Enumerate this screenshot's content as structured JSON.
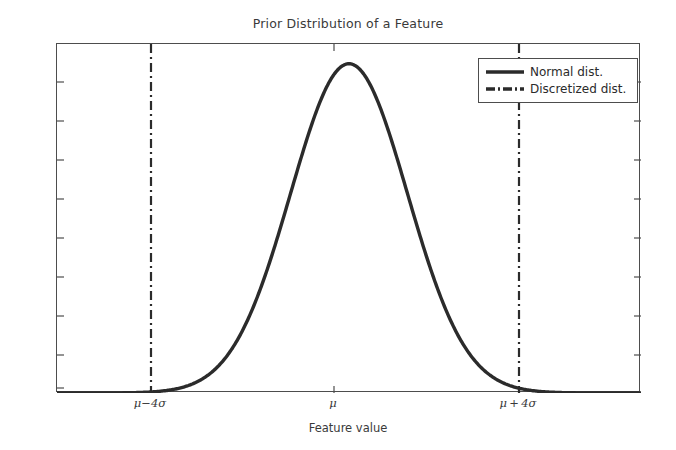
{
  "chart_data": {
    "type": "line",
    "title": "Prior Distribution of a Feature",
    "xlabel": "Feature value",
    "ylabel": "Probability",
    "grid": false,
    "legend_position": "upper right",
    "xlim": [
      -5.0,
      5.0
    ],
    "ylim": [
      0,
      1.06
    ],
    "xticks": [
      -4,
      0,
      4
    ],
    "xtick_labels": [
      "μ−4σ",
      "μ",
      "μ + 4σ"
    ],
    "ytick_labels": [],
    "yticks_count": 9,
    "series": [
      {
        "name": "Normal dist.",
        "type": "line",
        "style": "solid",
        "color": "#2b2b2b",
        "linewidth": 3,
        "description": "Standard normal probability density, peak normalized to 1.0 at x = μ",
        "x": [
          -5.0,
          -4.75,
          -4.5,
          -4.25,
          -4.0,
          -3.75,
          -3.5,
          -3.25,
          -3.0,
          -2.75,
          -2.5,
          -2.25,
          -2.0,
          -1.75,
          -1.5,
          -1.25,
          -1.0,
          -0.75,
          -0.5,
          -0.25,
          0.0,
          0.25,
          0.5,
          0.75,
          1.0,
          1.25,
          1.5,
          1.75,
          2.0,
          2.25,
          2.5,
          2.75,
          3.0,
          3.25,
          3.5,
          3.75,
          4.0,
          4.25,
          4.5,
          4.75,
          5.0
        ],
        "y": [
          0.0,
          0.0,
          0.0,
          0.0001,
          0.0003,
          0.0009,
          0.0022,
          0.0051,
          0.0111,
          0.0228,
          0.0439,
          0.0796,
          0.1353,
          0.2163,
          0.3247,
          0.4578,
          0.6065,
          0.7548,
          0.8825,
          0.9692,
          1.0,
          0.9692,
          0.8825,
          0.7548,
          0.6065,
          0.4578,
          0.3247,
          0.2163,
          0.1353,
          0.0796,
          0.0439,
          0.0228,
          0.0111,
          0.0051,
          0.0022,
          0.0009,
          0.0003,
          0.0001,
          0.0,
          0.0,
          0.0
        ]
      },
      {
        "name": "Discretized dist.",
        "type": "vline",
        "style": "dashdot",
        "color": "#2b2b2b",
        "linewidth": 2.2,
        "description": "Discretization boundaries at μ±4σ",
        "x": [
          -4,
          4
        ]
      }
    ]
  },
  "title": {
    "text": "Prior Distribution of a Feature"
  },
  "axes": {
    "xlabel": "Feature value",
    "ylabel": "Probability",
    "xtick_labels": [
      {
        "text": "μ−4σ",
        "x_px": 150
      },
      {
        "text": "μ",
        "x_px": 333
      },
      {
        "text": "μ + 4σ",
        "x_px": 518
      }
    ]
  },
  "legend": {
    "entries": [
      {
        "label": "Normal dist.",
        "style": "solid"
      },
      {
        "label": "Discretized dist.",
        "style": "dashdot"
      }
    ]
  },
  "colors": {
    "line": "#2b2b2b",
    "axis": "#4d4d4d",
    "background": "#ffffff",
    "text": "#3a3a3a"
  }
}
